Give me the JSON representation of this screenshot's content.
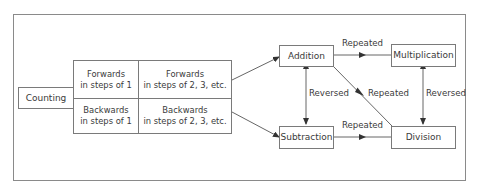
{
  "diagram": {
    "root": {
      "label": "Counting"
    },
    "grid": {
      "cells": [
        {
          "line1": "Forwards",
          "line2": "in steps of 1"
        },
        {
          "line1": "Forwards",
          "line2": "in steps of 2, 3, etc."
        },
        {
          "line1": "Backwards",
          "line2": "in steps of 1"
        },
        {
          "line1": "Backwards",
          "line2": "in steps of 2, 3, etc."
        }
      ]
    },
    "operations": {
      "addition": "Addition",
      "multiplication": "Multiplication",
      "subtraction": "Subtraction",
      "division": "Division"
    },
    "edges": {
      "add_to_mult": "Repeated",
      "sub_to_div": "Repeated",
      "add_to_div": "Repeated",
      "add_sub": "Reversed",
      "mult_div": "Reversed"
    },
    "colors": {
      "stroke": "#7a7a7a",
      "text": "#3a3a3a",
      "frame": "#8a8a8a"
    }
  }
}
